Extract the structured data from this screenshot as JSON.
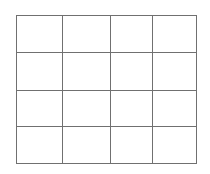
{
  "grid": {
    "rows": 4,
    "columns": 4,
    "line_color": "#707070",
    "columns_x": [
      16,
      62,
      110,
      152,
      196
    ],
    "rows_y": [
      15,
      52,
      90,
      126,
      163
    ]
  }
}
